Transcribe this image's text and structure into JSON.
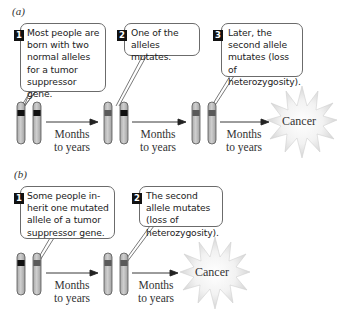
{
  "panels": [
    {
      "label": "(a)",
      "steps": [
        {
          "number": "1",
          "text": "Most people are born with two normal alleles for a tumor suppressor gene."
        },
        {
          "number": "2",
          "text": "One of the alleles mutates."
        },
        {
          "number": "3",
          "text": "Later, the second allele mutates (loss of heterozygosity)."
        }
      ],
      "arrows": [
        {
          "label_line1": "Months",
          "label_line2": "to years"
        },
        {
          "label_line1": "Months",
          "label_line2": "to years"
        },
        {
          "label_line1": "Months",
          "label_line2": "to years"
        }
      ],
      "outcome": "Cancer"
    },
    {
      "label": "(b)",
      "steps": [
        {
          "number": "1",
          "text": "Some people in-herit one mutated allele of a tumor suppressor gene."
        },
        {
          "number": "2",
          "text": "The second allele mutates (loss of heterozygosity)."
        }
      ],
      "arrows": [
        {
          "label_line1": "Months",
          "label_line2": "to years"
        },
        {
          "label_line1": "Months",
          "label_line2": "to years"
        }
      ],
      "outcome": "Cancer"
    }
  ],
  "colors": {
    "chromosome_body": "#bdbdbd",
    "chromosome_outline": "#555555",
    "normal_allele": "#111111",
    "mutated_allele": "#5a5a5a",
    "callout_border": "#6b6b6b",
    "starburst_fill": "#ececec"
  }
}
